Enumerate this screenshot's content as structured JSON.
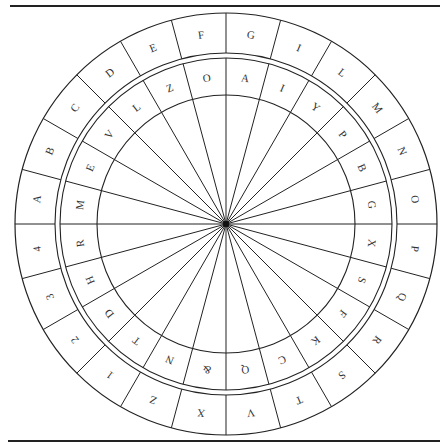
{
  "figure": {
    "center": [
      226,
      224
    ],
    "radii": {
      "outer": 211,
      "outer_ring_inner": 171,
      "inner_ring_outer": 166,
      "inner_ring_inner": 129
    },
    "segments": 24,
    "line_color": "#222222",
    "text_color": "#333333"
  },
  "outer_ring": {
    "labels_clockwise_from_top": [
      "G",
      "I",
      "L",
      "M",
      "N",
      "O",
      "P",
      "Q",
      "R",
      "S",
      "T",
      "V",
      "X",
      "Z",
      "1",
      "2",
      "3",
      "4",
      "A",
      "B",
      "C",
      "D",
      "E",
      "F"
    ]
  },
  "inner_ring": {
    "labels_clockwise_from_top": [
      "A",
      "I",
      "Y",
      "P",
      "B",
      "G",
      "X",
      "S",
      "F",
      "K",
      "C",
      "Q",
      "&",
      "N",
      "T",
      "D",
      "H",
      "R",
      "M",
      "E",
      "V",
      "L",
      "Z",
      "O"
    ]
  },
  "spokes": {
    "count": 24
  }
}
